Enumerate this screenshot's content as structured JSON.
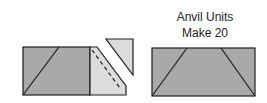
{
  "labels": {
    "line1": "Anvil Units",
    "line2": "Make 20"
  },
  "colors": {
    "dark_fabric": "#a9a9a9",
    "light_fabric": "#dcdcdc",
    "outline": "#1e1e1e"
  }
}
